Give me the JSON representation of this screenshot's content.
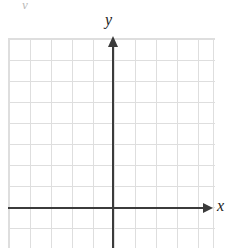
{
  "figure": {
    "type": "blank-coordinate-grid",
    "background_color": "#ffffff",
    "grid_color": "#dedede",
    "axis_color": "#3b3b3b",
    "label_color": "#1a1a1a",
    "top_artifact": "y"
  },
  "axes": {
    "x": {
      "label": "x",
      "arrow": "right-arrow-icon",
      "origin_y_px": 208
    },
    "y": {
      "label": "y",
      "arrow": "up-arrow-icon",
      "origin_x_px": 113
    }
  },
  "chart_data": {
    "type": "scatter",
    "title": "",
    "subtitle": "",
    "xlabel": "x",
    "ylabel": "y",
    "series": [
      {
        "name": "",
        "x": [],
        "y": []
      }
    ],
    "annotations": [],
    "legend": null,
    "grid": true,
    "grid_spacing_px": 21,
    "grid_columns": 10,
    "grid_rows": 10,
    "columns_left_of_axis": 5,
    "columns_right_of_axis": 5,
    "rows_above_axis": 8,
    "rows_below_axis": 2,
    "xlim": [
      -5,
      5
    ],
    "ylim": [
      -2,
      8
    ],
    "xticks": [],
    "yticks": [],
    "xticklabels": [],
    "yticklabels": []
  }
}
